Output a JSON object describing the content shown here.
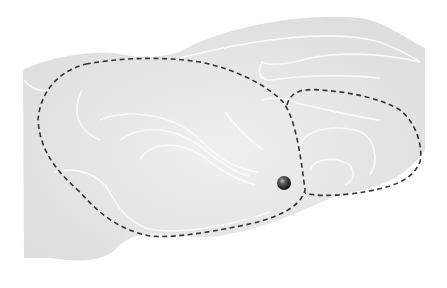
{
  "diagram": {
    "type": "energy-landscape-contour",
    "background": "#ffffff",
    "surface_color": "#e3e3e3",
    "contour_color": "#fafafa",
    "boundary_color": "#333333",
    "regions": [
      {
        "name": "left-basin",
        "boundary": "dashed"
      },
      {
        "name": "right-basin",
        "boundary": "dashed"
      }
    ],
    "marker": {
      "name": "ball",
      "color": "#3a3a3a",
      "cx": 284,
      "cy": 183,
      "r": 7
    }
  }
}
